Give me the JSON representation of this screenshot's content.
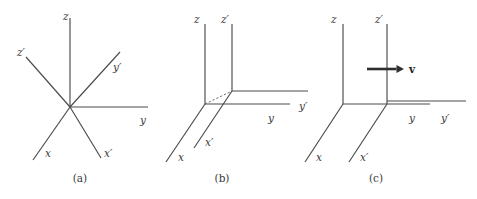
{
  "figure": {
    "width": 477,
    "height": 199,
    "background_color": "#ffffff",
    "line_color": "#4a4a4a",
    "label_color": "#3a3a3a",
    "arrow_color": "#2e2e2e"
  },
  "panels": [
    {
      "id": "panel-a",
      "caption": "(a)",
      "caption_pos": {
        "x": 80,
        "y": 182
      },
      "description": "Two coordinate frames sharing a common origin, primed frame rotated relative to unprimed frame",
      "origins": [
        {
          "name": "origin-unprimed",
          "x": 70,
          "y": 107
        }
      ],
      "axes": [
        {
          "name": "z-axis",
          "label": "z",
          "from": {
            "x": 70,
            "y": 107
          },
          "to": {
            "x": 70,
            "y": 18
          },
          "label_pos": {
            "x": 63,
            "y": 20
          },
          "dashed": false
        },
        {
          "name": "y-axis",
          "label": "y",
          "from": {
            "x": 70,
            "y": 107
          },
          "to": {
            "x": 148,
            "y": 107
          },
          "label_pos": {
            "x": 140,
            "y": 124
          },
          "dashed": false
        },
        {
          "name": "x-axis",
          "label": "x",
          "from": {
            "x": 70,
            "y": 107
          },
          "to": {
            "x": 33,
            "y": 160
          },
          "label_pos": {
            "x": 45,
            "y": 157
          },
          "dashed": false
        },
        {
          "name": "z-prime-axis",
          "label": "z′",
          "from": {
            "x": 70,
            "y": 107
          },
          "to": {
            "x": 26,
            "y": 57
          },
          "label_pos": {
            "x": 17,
            "y": 56
          },
          "dashed": false
        },
        {
          "name": "y-prime-axis",
          "label": "y′",
          "from": {
            "x": 70,
            "y": 107
          },
          "to": {
            "x": 120,
            "y": 52
          },
          "label_pos": {
            "x": 113,
            "y": 71
          },
          "dashed": false
        },
        {
          "name": "x-prime-axis",
          "label": "x′",
          "from": {
            "x": 70,
            "y": 107
          },
          "to": {
            "x": 101,
            "y": 158
          },
          "label_pos": {
            "x": 104,
            "y": 157
          },
          "dashed": false
        }
      ],
      "vectors": []
    },
    {
      "id": "panel-b",
      "caption": "(b)",
      "caption_pos": {
        "x": 222,
        "y": 182
      },
      "description": "Two parallel frames with origins displaced, connected by a dashed displacement line",
      "origins": [
        {
          "name": "origin-unprimed",
          "x": 205,
          "y": 104
        },
        {
          "name": "origin-primed",
          "x": 232,
          "y": 91
        }
      ],
      "axes": [
        {
          "name": "z-axis",
          "label": "z",
          "from": {
            "x": 205,
            "y": 104
          },
          "to": {
            "x": 205,
            "y": 24
          },
          "label_pos": {
            "x": 194,
            "y": 23
          },
          "dashed": false
        },
        {
          "name": "y-axis",
          "label": "y",
          "from": {
            "x": 205,
            "y": 104
          },
          "to": {
            "x": 290,
            "y": 104
          },
          "label_pos": {
            "x": 268,
            "y": 122
          },
          "dashed": false
        },
        {
          "name": "x-axis",
          "label": "x",
          "from": {
            "x": 205,
            "y": 104
          },
          "to": {
            "x": 166,
            "y": 162
          },
          "label_pos": {
            "x": 178,
            "y": 161
          },
          "dashed": false
        },
        {
          "name": "z-prime-axis",
          "label": "z′",
          "from": {
            "x": 232,
            "y": 91
          },
          "to": {
            "x": 232,
            "y": 24
          },
          "label_pos": {
            "x": 221,
            "y": 23
          },
          "dashed": false
        },
        {
          "name": "y-prime-axis",
          "label": "y′",
          "from": {
            "x": 232,
            "y": 91
          },
          "to": {
            "x": 308,
            "y": 91
          },
          "label_pos": {
            "x": 299,
            "y": 110
          },
          "dashed": false
        },
        {
          "name": "x-prime-axis",
          "label": "x′",
          "from": {
            "x": 232,
            "y": 91
          },
          "to": {
            "x": 194,
            "y": 148
          },
          "label_pos": {
            "x": 205,
            "y": 146
          },
          "dashed": false
        },
        {
          "name": "origin-offset-line",
          "label": "",
          "from": {
            "x": 205,
            "y": 104
          },
          "to": {
            "x": 232,
            "y": 91
          },
          "label_pos": {
            "x": 0,
            "y": 0
          },
          "dashed": true
        }
      ],
      "vectors": []
    },
    {
      "id": "panel-c",
      "caption": "(c)",
      "caption_pos": {
        "x": 376,
        "y": 182
      },
      "description": "Primed frame moving with velocity v along the common y direction",
      "origins": [
        {
          "name": "origin-unprimed",
          "x": 343,
          "y": 104
        },
        {
          "name": "origin-primed",
          "x": 387,
          "y": 104
        }
      ],
      "axes": [
        {
          "name": "z-axis",
          "label": "z",
          "from": {
            "x": 343,
            "y": 104
          },
          "to": {
            "x": 343,
            "y": 24
          },
          "label_pos": {
            "x": 331,
            "y": 23
          },
          "dashed": false
        },
        {
          "name": "y-axis",
          "label": "y",
          "from": {
            "x": 343,
            "y": 104
          },
          "to": {
            "x": 430,
            "y": 104
          },
          "label_pos": {
            "x": 409,
            "y": 122
          },
          "dashed": false
        },
        {
          "name": "x-axis",
          "label": "x",
          "from": {
            "x": 343,
            "y": 104
          },
          "to": {
            "x": 305,
            "y": 162
          },
          "label_pos": {
            "x": 316,
            "y": 161
          },
          "dashed": false
        },
        {
          "name": "z-prime-axis",
          "label": "z′",
          "from": {
            "x": 387,
            "y": 104
          },
          "to": {
            "x": 387,
            "y": 24
          },
          "label_pos": {
            "x": 375,
            "y": 23
          },
          "dashed": false
        },
        {
          "name": "y-prime-axis",
          "label": "y′",
          "from": {
            "x": 387,
            "y": 101
          },
          "to": {
            "x": 466,
            "y": 101
          },
          "label_pos": {
            "x": 441,
            "y": 122
          },
          "dashed": false
        },
        {
          "name": "x-prime-axis",
          "label": "x′",
          "from": {
            "x": 387,
            "y": 104
          },
          "to": {
            "x": 349,
            "y": 162
          },
          "label_pos": {
            "x": 360,
            "y": 161
          },
          "dashed": false
        }
      ],
      "vectors": [
        {
          "name": "velocity-vector",
          "label": "v",
          "from": {
            "x": 367,
            "y": 69
          },
          "to": {
            "x": 404,
            "y": 69
          },
          "label_pos": {
            "x": 409,
            "y": 73
          },
          "bold": true
        }
      ]
    }
  ]
}
